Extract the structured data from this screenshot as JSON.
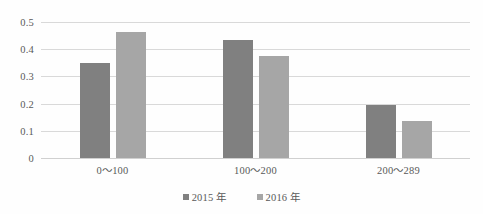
{
  "chart_data": {
    "type": "bar",
    "title": "",
    "subtitle": "",
    "xlabel": "",
    "ylabel": "",
    "categories": [
      "0～100",
      "100～200",
      "200～289"
    ],
    "series": [
      {
        "name": "2015 年",
        "color": "#808080",
        "values": [
          0.35,
          0.435,
          0.195
        ]
      },
      {
        "name": "2016 年",
        "color": "#a6a6a6",
        "values": [
          0.465,
          0.375,
          0.135
        ]
      }
    ],
    "ylim": [
      0,
      0.5
    ],
    "ytick_values": [
      0.5,
      0.4,
      0.3,
      0.2,
      0.1,
      0
    ],
    "ytick_labels": [
      "0.5",
      "0.4",
      "0.3",
      "0.2",
      "0.1",
      "0"
    ],
    "grid": "horizontal",
    "legend_position": "bottom",
    "legend_marker": "square",
    "plot_background": "#ffffff",
    "gridline_color": "#d9d9d9",
    "text_color": "#595959"
  }
}
